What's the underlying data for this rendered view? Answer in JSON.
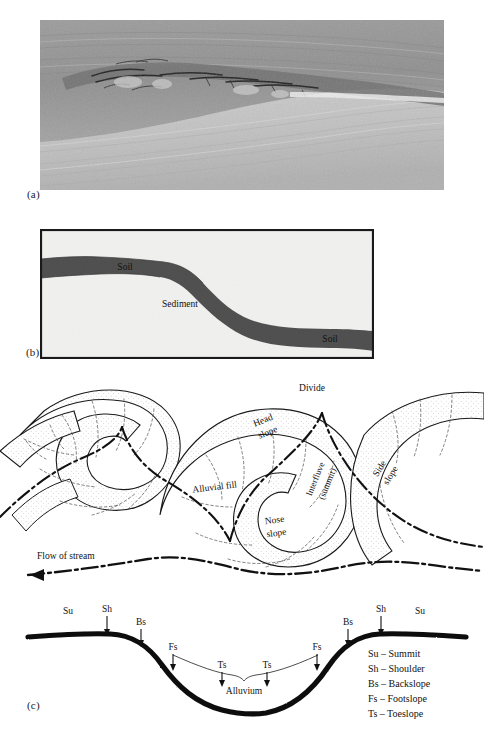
{
  "figure": {
    "panel_letters": {
      "a": "(a)",
      "b": "(b)",
      "c": "(c)"
    }
  },
  "panel_a": {
    "letter": "(a)",
    "type": "photograph",
    "description": "Grayscale photograph of an exposed sediment face with a dark buried soil horizon band",
    "alt_caption": "Buried soil horizon exposed in sediment face"
  },
  "panel_b": {
    "letter": "(b)",
    "type": "schematic-cross-section",
    "labels": {
      "soil_upper": "Soil",
      "sediment": "Sediment",
      "soil_lower": "Soil"
    },
    "colors": {
      "background": "#f0f0ee",
      "soil_band": "#4e4e4e",
      "border": "#1a1a1a"
    }
  },
  "panel_meander": {
    "type": "planview-landform-diagram",
    "labels": {
      "divide": "Divide",
      "head_slope": "Head\nslope",
      "head_slope_line1": "Head",
      "head_slope_line2": "slope",
      "interfluve_line1": "Interfluve",
      "interfluve_line2": "(summit)",
      "side_slope_line1": "Side",
      "side_slope_line2": "slope",
      "alluvial_fill": "Alluvial fill",
      "nose_slope_line1": "Nose",
      "nose_slope_line2": "slope",
      "flow_of_stream": "Flow of stream"
    },
    "colors": {
      "outline": "#1a1a1a",
      "stipple": "#9a9a9a",
      "dashed_divider": "#5a5a5a",
      "stream_line": "#111111"
    }
  },
  "panel_c": {
    "letter": "(c)",
    "type": "hillslope-catena-cross-section",
    "surface_label": "Alluvium",
    "position_markers": [
      {
        "code": "Su",
        "x": 68,
        "y": 612,
        "arrow": false
      },
      {
        "code": "Sh",
        "x": 107,
        "y": 610,
        "arrow": true
      },
      {
        "code": "Bs",
        "x": 140,
        "y": 628,
        "arrow": true
      },
      {
        "code": "Fs",
        "x": 172,
        "y": 650,
        "arrow": true
      },
      {
        "code": "Ts",
        "x": 222,
        "y": 668,
        "arrow": true
      },
      {
        "code": "Ts",
        "x": 266,
        "y": 668,
        "arrow": true
      },
      {
        "code": "Fs",
        "x": 316,
        "y": 650,
        "arrow": true
      },
      {
        "code": "Bs",
        "x": 347,
        "y": 628,
        "arrow": true
      },
      {
        "code": "Sh",
        "x": 381,
        "y": 610,
        "arrow": true
      },
      {
        "code": "Su",
        "x": 419,
        "y": 612,
        "arrow": false
      }
    ],
    "legend": [
      {
        "code": "Su",
        "dash": "–",
        "name": "Summit"
      },
      {
        "code": "Sh",
        "dash": "–",
        "name": "Shoulder"
      },
      {
        "code": "Bs",
        "dash": "–",
        "name": "Backslope"
      },
      {
        "code": "Fs",
        "dash": "–",
        "name": "Footslope"
      },
      {
        "code": "Ts",
        "dash": "–",
        "name": "Toeslope"
      }
    ],
    "legend_lines": [
      "Su – Summit",
      "Sh – Shoulder",
      "Bs – Backslope",
      "Fs – Footslope",
      "Ts – Toeslope"
    ],
    "colors": {
      "surface_line": "#0d0d0d",
      "alluvium_line": "#3a3a3a"
    }
  }
}
